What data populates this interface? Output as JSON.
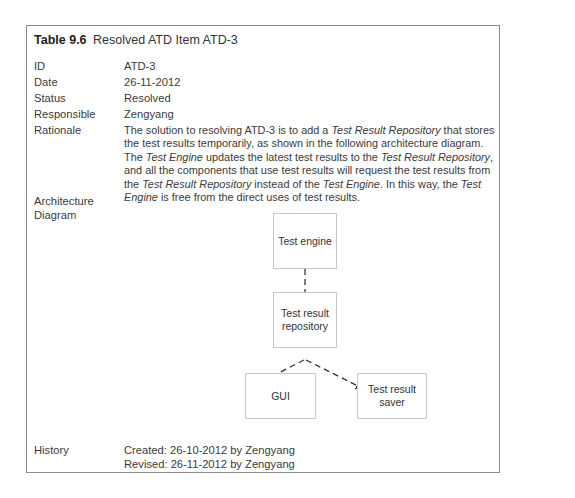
{
  "table": {
    "number": "Table 9.6",
    "caption": "Resolved ATD Item ATD-3"
  },
  "rows": {
    "id": {
      "label": "ID",
      "value": "ATD-3"
    },
    "date": {
      "label": "Date",
      "value": "26-11-2012"
    },
    "status": {
      "label": "Status",
      "value": "Resolved"
    },
    "responsible": {
      "label": "Responsible",
      "value": "Zengyang"
    },
    "rationale": {
      "label": "Rationale",
      "parts": [
        "The solution to resolving ATD-3 is to add a ",
        "Test Result Repository",
        " that stores the test results temporarily, as shown in the following architecture diagram. The ",
        "Test Engine",
        " updates the latest test results to the ",
        "Test Result Repository",
        ", and all the components that use test results will request the test results from the ",
        "Test Result Repository",
        " instead of the ",
        "Test Engine",
        ". In this way, the ",
        "Test Engine",
        " is free from the direct uses of test results."
      ]
    },
    "architecture": {
      "label_line1": "Architecture",
      "label_line2": "Diagram"
    },
    "history": {
      "label": "History",
      "created": "Created: 26-10-2012 by Zengyang",
      "revised": "Revised: 26-11-2012 by Zengyang"
    }
  },
  "diagram": {
    "nodes": {
      "engine": "Test engine",
      "repo_line1": "Test result",
      "repo_line2": "repository",
      "gui": "GUI",
      "saver_line1": "Test result",
      "saver_line2": "saver"
    },
    "edges": [
      {
        "from": "Test engine",
        "to": "Test result repository",
        "style": "dashed-arrow"
      },
      {
        "from": "Test result repository",
        "to": "GUI",
        "style": "dashed-arrow"
      },
      {
        "from": "Test result repository",
        "to": "Test result saver",
        "style": "dashed-arrow"
      }
    ]
  }
}
